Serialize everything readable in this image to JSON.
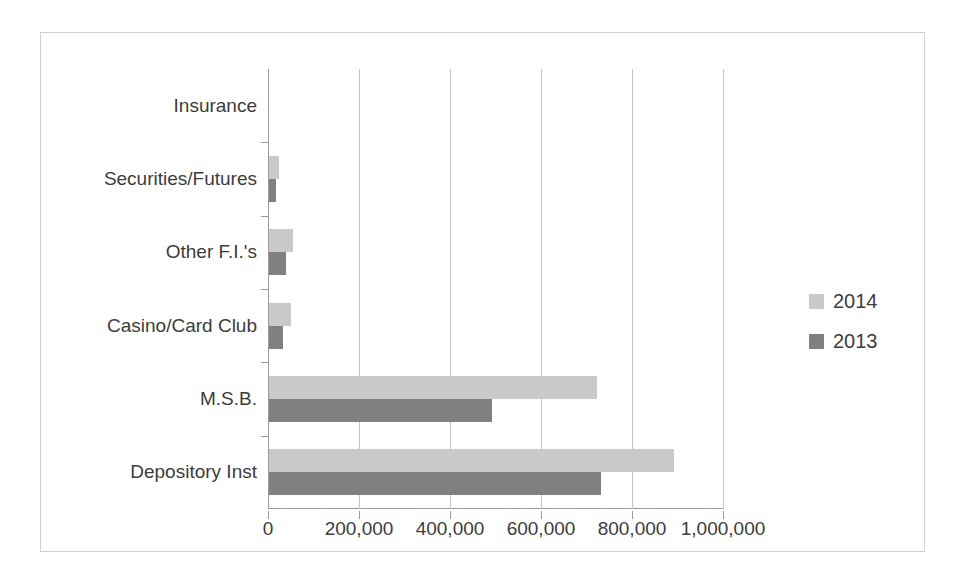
{
  "chart_data": {
    "type": "bar",
    "orientation": "horizontal",
    "title": "",
    "xlabel": "",
    "ylabel": "",
    "categories": [
      "Insurance",
      "Securities/Futures",
      "Other F.I.'s",
      "Casino/Card Club",
      "M.S.B.",
      "Depository Inst"
    ],
    "series": [
      {
        "name": "2014",
        "color": "#c9c9c9",
        "values": [
          0,
          22000,
          53000,
          48000,
          720000,
          890000
        ]
      },
      {
        "name": "2013",
        "color": "#808080",
        "values": [
          0,
          15000,
          37000,
          31000,
          490000,
          730000
        ]
      }
    ],
    "xlim": [
      0,
      1000000
    ],
    "xticks": [
      0,
      200000,
      400000,
      600000,
      800000,
      1000000
    ],
    "xtick_labels": [
      "0",
      "200,000",
      "400,000",
      "600,000",
      "800,000",
      "1,000,000"
    ],
    "grid": true,
    "grid_axis": "x",
    "legend": {
      "position": "right",
      "entries": [
        "2014",
        "2013"
      ]
    }
  },
  "legend": {
    "items": [
      {
        "label": "2014",
        "color": "#c9c9c9"
      },
      {
        "label": "2013",
        "color": "#808080"
      }
    ]
  }
}
